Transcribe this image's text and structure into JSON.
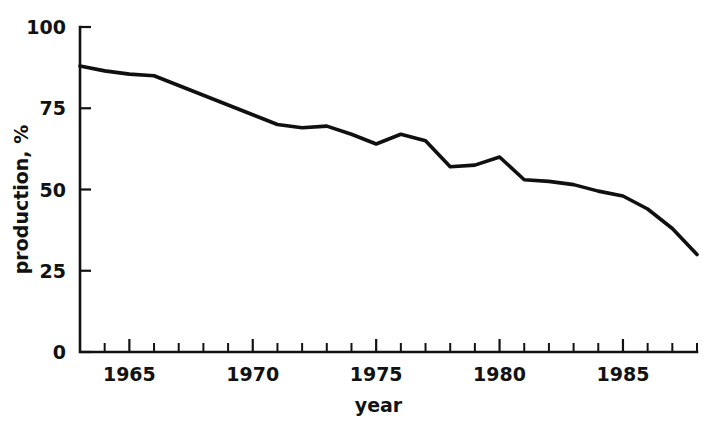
{
  "chart_data": {
    "type": "line",
    "title": "",
    "xlabel": "year",
    "ylabel": "production, %",
    "xlim": [
      1963,
      1988
    ],
    "ylim": [
      0,
      100
    ],
    "grid": false,
    "legend": null,
    "x_tick_labels": [
      "1965",
      "1970",
      "1975",
      "1980",
      "1985"
    ],
    "x_tick_label_values": [
      1965,
      1970,
      1975,
      1980,
      1985
    ],
    "x_minor_tick_values": [
      1963,
      1964,
      1965,
      1966,
      1967,
      1968,
      1969,
      1970,
      1971,
      1972,
      1973,
      1974,
      1975,
      1976,
      1977,
      1978,
      1979,
      1980,
      1981,
      1982,
      1983,
      1984,
      1985,
      1986,
      1987,
      1988
    ],
    "y_tick_labels": [
      "0",
      "25",
      "50",
      "75",
      "100"
    ],
    "y_tick_values": [
      0,
      25,
      50,
      75,
      100
    ],
    "series": [
      {
        "name": "production",
        "color": "#101010",
        "x": [
          1963,
          1964,
          1965,
          1966,
          1967,
          1968,
          1969,
          1970,
          1971,
          1972,
          1973,
          1974,
          1975,
          1976,
          1977,
          1978,
          1979,
          1980,
          1981,
          1982,
          1983,
          1984,
          1985,
          1986,
          1987,
          1988
        ],
        "values": [
          88,
          86.5,
          85.5,
          85,
          82,
          79,
          76,
          73,
          70,
          69,
          69.5,
          67,
          64,
          67,
          65,
          57,
          57.5,
          60,
          53,
          52.5,
          51.5,
          49.5,
          48,
          44,
          38,
          30
        ]
      }
    ]
  },
  "figure": {
    "background_color": "#ffffff",
    "axis_color": "#121212"
  }
}
